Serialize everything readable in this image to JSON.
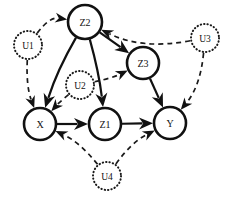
{
  "figure": {
    "width": 233,
    "height": 201,
    "background_color": "#ffffff",
    "stroke_color": "#111111"
  },
  "nodes": [
    {
      "id": "Z2",
      "label": "Z2",
      "type": "observed",
      "cx": 85,
      "cy": 22,
      "r": 17
    },
    {
      "id": "Z3",
      "label": "Z3",
      "type": "observed",
      "cx": 143,
      "cy": 63,
      "r": 16
    },
    {
      "id": "X",
      "label": "X",
      "type": "observed",
      "cx": 40,
      "cy": 124,
      "r": 16
    },
    {
      "id": "Z1",
      "label": "Z1",
      "type": "observed",
      "cx": 105,
      "cy": 124,
      "r": 16
    },
    {
      "id": "Y",
      "label": "Y",
      "type": "observed",
      "cx": 170,
      "cy": 123,
      "r": 16
    },
    {
      "id": "U1",
      "label": "U1",
      "type": "latent",
      "cx": 28,
      "cy": 45,
      "r": 14
    },
    {
      "id": "U2",
      "label": "U2",
      "type": "latent",
      "cx": 80,
      "cy": 85,
      "r": 14
    },
    {
      "id": "U3",
      "label": "U3",
      "type": "latent",
      "cx": 205,
      "cy": 38,
      "r": 14
    },
    {
      "id": "U4",
      "label": "U4",
      "type": "latent",
      "cx": 107,
      "cy": 176,
      "r": 14
    }
  ],
  "edges": [
    {
      "from": "Z2",
      "to": "X",
      "style": "solid",
      "name": "edge-z2-x"
    },
    {
      "from": "Z2",
      "to": "Z1",
      "style": "solid",
      "name": "edge-z2-z1"
    },
    {
      "from": "Z2",
      "to": "Z3",
      "style": "solid",
      "name": "edge-z2-z3"
    },
    {
      "from": "Z3",
      "to": "Y",
      "style": "solid",
      "name": "edge-z3-y"
    },
    {
      "from": "X",
      "to": "Z1",
      "style": "solid",
      "name": "edge-x-z1"
    },
    {
      "from": "Z1",
      "to": "Y",
      "style": "solid",
      "name": "edge-z1-y"
    },
    {
      "from": "U1",
      "to": "Z2",
      "style": "dashed",
      "name": "edge-u1-z2"
    },
    {
      "from": "U1",
      "to": "X",
      "style": "dashed",
      "name": "edge-u1-x"
    },
    {
      "from": "U2",
      "to": "X",
      "style": "dashed",
      "name": "edge-u2-x"
    },
    {
      "from": "U2",
      "to": "Z3",
      "style": "dashed",
      "name": "edge-u2-z3"
    },
    {
      "from": "U3",
      "to": "Z2",
      "style": "dashed",
      "name": "edge-u3-z2"
    },
    {
      "from": "U3",
      "to": "Y",
      "style": "dashed",
      "name": "edge-u3-y"
    },
    {
      "from": "U4",
      "to": "X",
      "style": "dashed",
      "name": "edge-u4-x"
    },
    {
      "from": "U4",
      "to": "Y",
      "style": "dashed",
      "name": "edge-u4-y"
    }
  ],
  "labels": {
    "Z2": "Z2",
    "Z3": "Z3",
    "Z1": "Z1",
    "X": "X",
    "Y": "Y",
    "U1": "U1",
    "U2": "U2",
    "U3": "U3",
    "U4": "U4"
  }
}
